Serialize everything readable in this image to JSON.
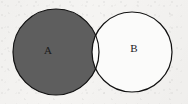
{
  "figure": {
    "kind": "venn-diagram",
    "width": 188,
    "height": 104,
    "background_color": "#f5f4f2",
    "outline_color": "#111111",
    "shaded_color": "#5e5e5e",
    "unshaded_color": "#fbfbfa",
    "shaded_region_meaning": "A minus B (difference): the part of A outside B is shaded; the overlap A and B is unshaded",
    "sets": [
      {
        "id": "A",
        "label": "A",
        "filled": true,
        "fill_color": "#5e5e5e",
        "stroke_color": "#111111",
        "stroke_width": 1.2,
        "center_x": 56,
        "center_y": 52,
        "radius": 43,
        "label_x": 48,
        "label_y": 51,
        "label_color": "#1a1a1a"
      },
      {
        "id": "B",
        "label": "B",
        "filled": false,
        "fill_color": "#fbfbfa",
        "stroke_color": "#111111",
        "stroke_width": 1.2,
        "center_x": 132,
        "center_y": 52,
        "radius": 40,
        "label_x": 134,
        "label_y": 49,
        "label_color": "#1a1a1a"
      }
    ],
    "intersection": {
      "id": "A-and-B",
      "filled": false,
      "fill_color": "#fbfbfa"
    }
  }
}
